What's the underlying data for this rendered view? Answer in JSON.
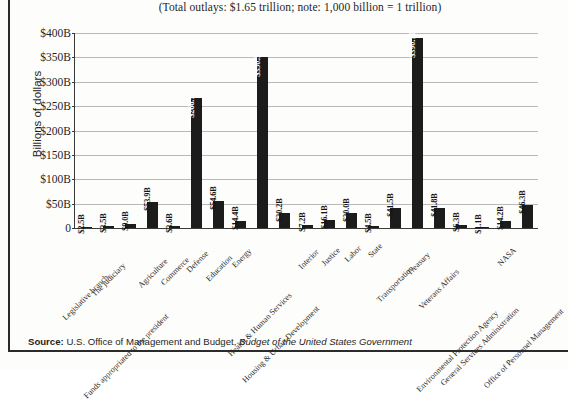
{
  "page": {
    "source_label": "Source:",
    "source_text": " U.S. Office of Management and Budget, ",
    "source_italic": "Budget of the United States Government"
  },
  "chart_data": {
    "type": "bar",
    "title": "(Total outlays: $1.65 trillion; note: 1,000 billion = 1 trillion)",
    "xlabel": "",
    "ylabel": "Billions of dollars",
    "ylim": [
      0,
      400
    ],
    "grid": true,
    "legend": "none",
    "ytick_labels": [
      "$400B",
      "$350B",
      "$300B",
      "$250B",
      "$200B",
      "$150B",
      "$100B",
      "$50B",
      "0"
    ],
    "ytick_values": [
      400,
      350,
      300,
      250,
      200,
      150,
      100,
      50,
      0
    ],
    "units": "Billions of dollars",
    "categories": [
      "Legislative branch",
      "The judiciary",
      "Funds appropriated to the president",
      "Agriculture",
      "Commerce",
      "Defense",
      "Education",
      "Energy",
      "Health & Human Services",
      "Housing & Urban Development",
      "Interior",
      "Justice",
      "Labor",
      "State",
      "Transportation",
      "Treasury",
      "Veterans Affairs",
      "Environmental Protection Agency",
      "General Services Administration",
      "NASA",
      "Office of Personnel Management"
    ],
    "values": [
      2.5,
      3.5,
      9.0,
      53.9,
      3.6,
      266.1,
      54.6,
      14.4,
      350.5,
      30.2,
      7.2,
      16.1,
      30.0,
      4.5,
      41.5,
      390.1,
      41.8,
      6.3,
      1.1,
      14.2,
      46.3
    ],
    "data_labels": [
      "$2.5B",
      "$3.5B",
      "$9.0B",
      "$53.9B",
      "$3.6B",
      "$266.1B",
      "$54.6B",
      "$14.4B",
      "$350.5B",
      "$30.2B",
      "$7.2B",
      "$16.1B",
      "$30.0B",
      "$4.5B",
      "$41.5B",
      "$390.1B",
      "$41.8B",
      "$6.3B",
      "$1.1B",
      "$14.2B",
      "$46.3B"
    ],
    "bar_color": "#1c1c1c",
    "grid_color": "#b9b9b9",
    "axis_color": "#3a3a3a",
    "total_outlays": "$1.65 trillion"
  }
}
